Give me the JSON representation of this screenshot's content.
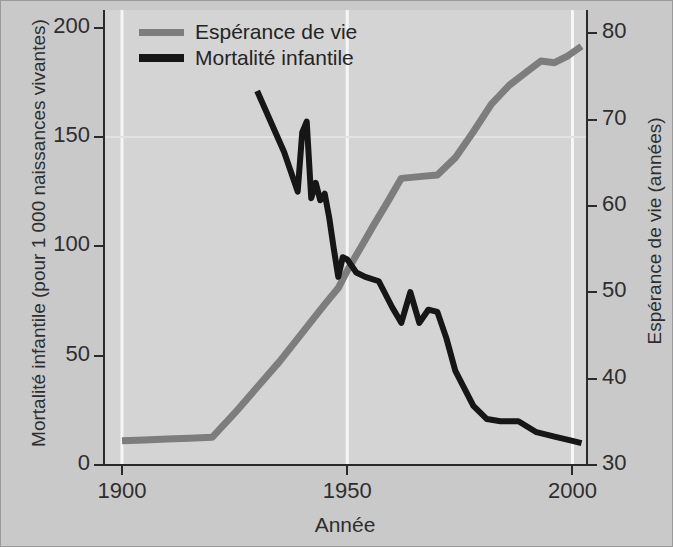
{
  "figure": {
    "background": "#c9c9c9",
    "panel_background": "#d4d4d4",
    "grid_color": "#f2f2f2"
  },
  "legend": {
    "position": "top-left",
    "items": [
      {
        "label": "Espérance de vie",
        "color": "#7d7d7d"
      },
      {
        "label": "Mortalité infantile",
        "color": "#161616"
      }
    ]
  },
  "axes": {
    "x": {
      "label": "Année",
      "ticks": [
        "1900",
        "1950",
        "2000"
      ],
      "tick_values": [
        1900,
        1950,
        2000
      ],
      "range": [
        1896,
        2003
      ]
    },
    "y_left": {
      "label": "Mortalité infantile (pour 1 000 naissances vivantes)",
      "ticks": [
        "0",
        "50",
        "100",
        "150",
        "200"
      ],
      "tick_values": [
        0,
        50,
        100,
        150,
        200
      ],
      "range": [
        0,
        208
      ]
    },
    "y_right": {
      "label": "Espérance de vie (années)",
      "ticks": [
        "30",
        "40",
        "50",
        "60",
        "70",
        "80"
      ],
      "tick_values": [
        30,
        40,
        50,
        60,
        70,
        80
      ],
      "range": [
        30,
        82.7
      ]
    }
  },
  "chart_data": {
    "type": "line",
    "title": "",
    "xlabel": "Année",
    "ylabel": "Mortalité infantile (pour 1 000 naissances vivantes)",
    "ylabel_right": "Espérance de vie (années)",
    "xlim": [
      1896,
      2003
    ],
    "ylim": [
      0,
      208
    ],
    "ylim_right": [
      30,
      82.7
    ],
    "grid": "white vertical gridlines at 1900, 1950, 2000; faint horizontal line at 150",
    "legend_position": "upper left",
    "series": [
      {
        "name": "Espérance de vie",
        "color": "#7d7d7d",
        "axis": "right",
        "units": "années",
        "x": [
          1900,
          1905,
          1910,
          1915,
          1920,
          1925,
          1930,
          1935,
          1940,
          1945,
          1948,
          1950,
          1953,
          1956,
          1959,
          1962,
          1966,
          1970,
          1974,
          1978,
          1982,
          1986,
          1990,
          1993,
          1996,
          1999,
          2002
        ],
        "y": [
          32.8,
          32.9,
          33.0,
          33.1,
          33.2,
          36.0,
          39.0,
          42.0,
          45.3,
          48.6,
          50.5,
          52.5,
          55.2,
          57.9,
          60.5,
          63.2,
          63.4,
          63.6,
          65.6,
          68.6,
          71.8,
          74.0,
          75.6,
          76.8,
          76.6,
          77.4,
          78.5
        ]
      },
      {
        "name": "Mortalité infantile",
        "color": "#161616",
        "axis": "left",
        "units": "pour 1 000 naissances vivantes",
        "x": [
          1930,
          1936,
          1938,
          1939,
          1940,
          1941,
          1942,
          1943,
          1944,
          1945,
          1946,
          1947,
          1948,
          1949,
          1950,
          1952,
          1954,
          1957,
          1960,
          1962,
          1964,
          1966,
          1968,
          1970,
          1972,
          1974,
          1976,
          1978,
          1981,
          1984,
          1988,
          1992,
          1996,
          2000,
          2002
        ],
        "y": [
          171,
          143,
          131,
          125,
          152,
          157,
          122,
          129,
          121,
          124,
          113,
          99,
          86,
          95,
          94,
          88,
          86,
          84,
          72,
          65,
          79,
          65,
          71,
          70,
          58,
          43,
          35,
          27,
          21,
          20,
          20,
          15,
          13,
          11,
          10
        ]
      }
    ]
  }
}
